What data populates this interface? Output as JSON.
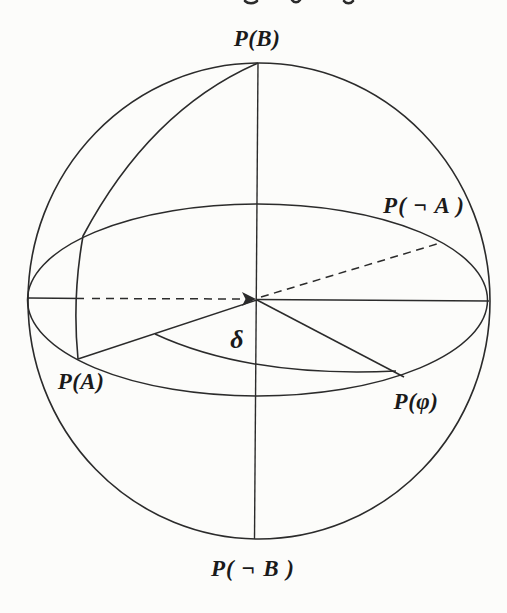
{
  "figure": {
    "type": "sphere-probability-diagram",
    "labels": {
      "top_pole": "P(B)",
      "neg_a": "P( ¬ A )",
      "a": "P(A)",
      "phi": "P(φ)",
      "bottom_pole": "P( ¬ B )",
      "angle": "δ"
    },
    "colors": {
      "ink": "#2b2b2b",
      "paper": "#fcfcfa",
      "label": "#1a1a1a"
    }
  }
}
